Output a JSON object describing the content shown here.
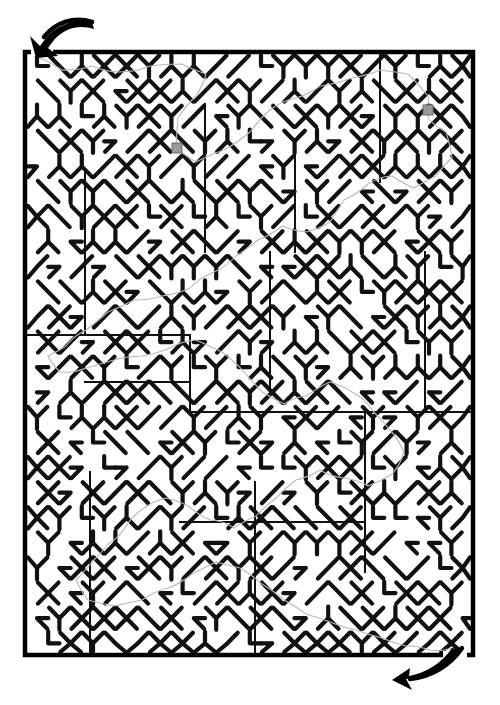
{
  "page": {
    "background_color": "#ffffff",
    "width": 500,
    "height": 705
  },
  "maze": {
    "type": "triangular-lattice-maze",
    "border": {
      "label": "maze-outer-border",
      "x": 25,
      "y": 52,
      "width": 448,
      "height": 603,
      "stroke_color": "#000000",
      "stroke_width": 4.5
    },
    "wall_color": "#111111",
    "wall_stroke_width": 4.2,
    "divider_color": "#111111",
    "divider_stroke_width": 2.0,
    "grid": {
      "cols": 20,
      "rows": 24,
      "cell_width": 22.4,
      "cell_height": 25.1,
      "angles_deg": [
        0,
        60,
        120,
        180,
        240,
        300
      ]
    },
    "entrance": {
      "label": "entrance-arrow",
      "position": "top-left",
      "description": "curved arrow pointing down-left into the maze opening",
      "color": "#000000",
      "tip_x": 41,
      "tip_y": 56
    },
    "exit": {
      "label": "exit-arrow",
      "position": "bottom-right",
      "description": "curved arrow pointing down-left out of the maze opening",
      "color": "#000000",
      "tip_x": 409,
      "tip_y": 672
    },
    "solution_path": {
      "label": "solution-trace",
      "color": "#b8b8b8",
      "stroke_width": 1.1,
      "visible": true,
      "description": "faint gray line tracing the route from the top-left entrance to the bottom-right exit"
    },
    "markers": [
      {
        "label": "marker-square-1",
        "x": 177,
        "y": 148,
        "size": 10,
        "color": "#9a9a9a"
      },
      {
        "label": "marker-square-2",
        "x": 428,
        "y": 110,
        "size": 10,
        "color": "#9a9a9a"
      }
    ]
  }
}
